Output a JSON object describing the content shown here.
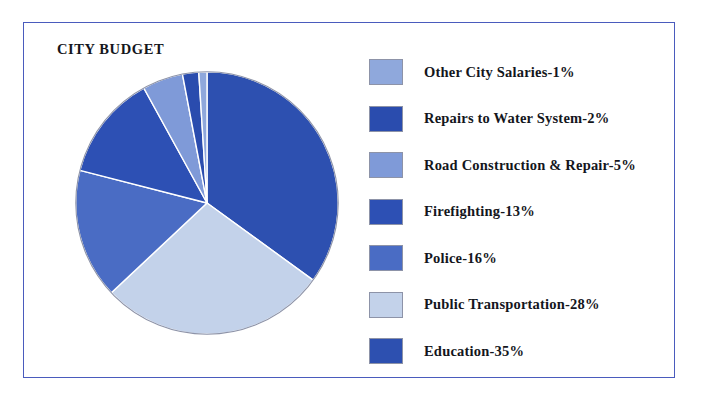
{
  "chart_data": {
    "type": "pie",
    "title": "CITY BUDGET",
    "categories": [
      "Other City Salaries",
      "Repairs to Water System",
      "Road Construction & Repair",
      "Firefighting",
      "Police",
      "Public Transportation",
      "Education"
    ],
    "values": [
      1,
      2,
      5,
      13,
      16,
      28,
      35
    ],
    "unit": "%",
    "legend_position": "right",
    "grid": false,
    "slice_colors": [
      "#8fa8dc",
      "#2a4cae",
      "#7f9ad8",
      "#2d50b4",
      "#4a6cc4",
      "#c3d2ea",
      "#2d50b0"
    ],
    "slice_order_clockwise_from_top": [
      "Education-35%",
      "Public Transportation-28%",
      "Police-16%",
      "Firefighting-13%",
      "Road Construction & Repair-5%",
      "Repairs to Water System-2%",
      "Other City Salaries-1%"
    ],
    "legend": [
      {
        "label": "Other City Salaries-1%",
        "color": "#8fa8dc",
        "value": 1
      },
      {
        "label": "Repairs to Water System-2%",
        "color": "#2a4cae",
        "value": 2
      },
      {
        "label": "Road Construction & Repair-5%",
        "color": "#7f9ad8",
        "value": 5
      },
      {
        "label": "Firefighting-13%",
        "color": "#2d50b4",
        "value": 13
      },
      {
        "label": "Police-16%",
        "color": "#4a6cc4",
        "value": 16
      },
      {
        "label": "Public Transportation-28%",
        "color": "#c3d2ea",
        "value": 28
      },
      {
        "label": "Education-35%",
        "color": "#2d50b0",
        "value": 35
      }
    ]
  },
  "frame": {
    "border_color": "#4a5bbd",
    "background": "#ffffff"
  }
}
